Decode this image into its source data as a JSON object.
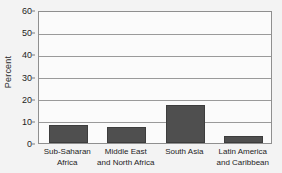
{
  "chart_data": {
    "type": "bar",
    "title": "",
    "subtitle": "",
    "xlabel": "",
    "ylabel": "Percent",
    "ylim": [
      0,
      60
    ],
    "y_ticks": [
      0,
      10,
      20,
      30,
      40,
      50,
      60
    ],
    "y_tick_labels": [
      "0",
      "10",
      "20",
      "30",
      "40",
      "50",
      "60"
    ],
    "grid": true,
    "grid_axis": "y",
    "legend": false,
    "legend_position": "none",
    "categories": [
      "Sub-Saharan\nAfrica",
      "Middle East\nand North Africa",
      "South Asia",
      "Latin America\nand Caribbean"
    ],
    "values": [
      8,
      7,
      17,
      3
    ],
    "series": [
      {
        "name": "Percent",
        "values": [
          8,
          7,
          17,
          3
        ]
      }
    ],
    "colors": {
      "bar_fill": "#4f4f4f",
      "bar_edge": "#3d3d3d",
      "plot_background": "#fbfbfb",
      "figure_background": "#f3f3f3",
      "gridline": "#9a9a9a",
      "frame": "#8f8f8f",
      "text": "#1d1d1d"
    }
  }
}
